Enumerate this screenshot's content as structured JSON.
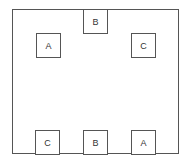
{
  "diagram": {
    "boxes": [
      {
        "label": "B",
        "position": "top-center"
      },
      {
        "label": "A",
        "position": "upper-left"
      },
      {
        "label": "C",
        "position": "upper-right"
      },
      {
        "label": "C",
        "position": "bottom-left"
      },
      {
        "label": "B",
        "position": "bottom-center"
      },
      {
        "label": "A",
        "position": "bottom-right"
      }
    ]
  }
}
